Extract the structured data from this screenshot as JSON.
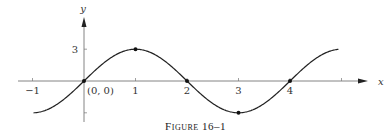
{
  "caption": "Figure 16–1",
  "chart_data": {
    "type": "line",
    "title": "Figure 16–1",
    "xlabel": "x",
    "ylabel": "y",
    "function": "y = 3 sin(πx/2)",
    "x_ticks": [
      -1,
      1,
      2,
      3,
      4,
      5
    ],
    "x_tick_labels": [
      "−1",
      "1",
      "2",
      "3",
      "4",
      ""
    ],
    "y_ticks": [
      3,
      -3
    ],
    "y_tick_labels": [
      "3",
      ""
    ],
    "origin_label": "(0, 0)",
    "xlim": [
      -1.3,
      5.6
    ],
    "ylim": [
      -3.6,
      6.5
    ],
    "grid": false,
    "marked_points": [
      {
        "x": 0,
        "y": 0
      },
      {
        "x": 1,
        "y": 3
      },
      {
        "x": 2,
        "y": 0
      },
      {
        "x": 3,
        "y": -3
      },
      {
        "x": 4,
        "y": 0
      }
    ],
    "series": [
      {
        "name": "curve",
        "x": [
          -1,
          -0.5,
          0,
          0.5,
          1,
          1.5,
          2,
          2.5,
          3,
          3.5,
          4,
          4.5,
          4.95
        ],
        "values": [
          -3,
          -2.12,
          0,
          2.12,
          3,
          2.12,
          0,
          -2.12,
          -3,
          -2.12,
          0,
          2.12,
          3.0
        ]
      }
    ],
    "colors": {
      "curve": "#222222",
      "axes": "#555555"
    }
  }
}
